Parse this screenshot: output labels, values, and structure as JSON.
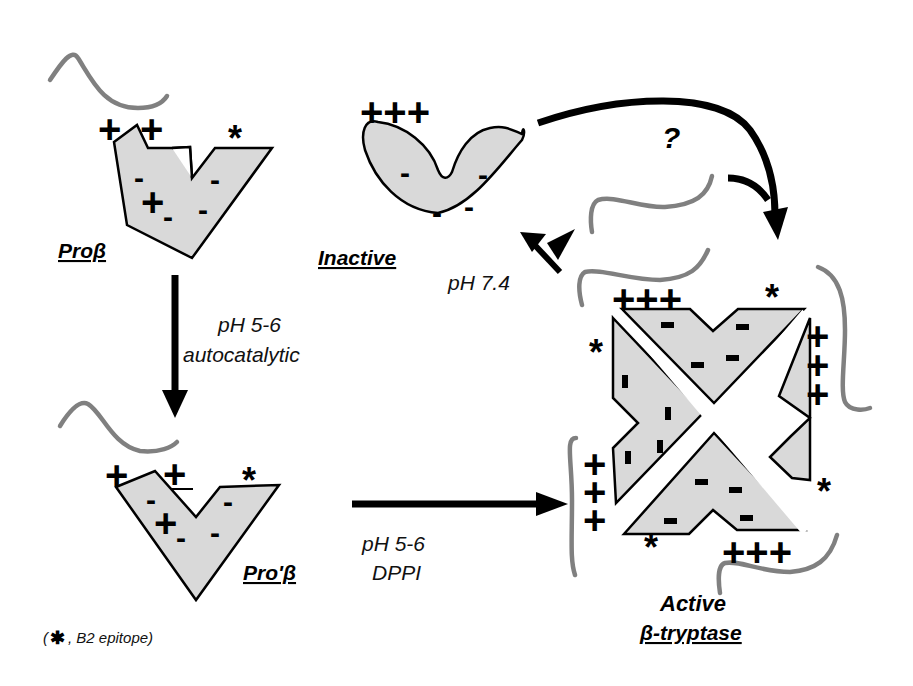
{
  "diagram": {
    "colors": {
      "protein_fill": "#d9d9d9",
      "outline": "#000000",
      "propeptide": "#808080",
      "arrow": "#000000"
    },
    "nodes": {
      "pro_beta": {
        "label": "Proβ",
        "charges_top": [
          "+",
          "+"
        ],
        "epitope": "*",
        "internal": [
          "-",
          "+",
          "-",
          "-",
          "-"
        ]
      },
      "inactive": {
        "label": "Inactive",
        "charges_top": "+++",
        "internal": [
          "-",
          "-",
          "-",
          "-"
        ]
      },
      "pro_prime_beta": {
        "label": "Pro'β",
        "charges_top": [
          "+",
          "+"
        ],
        "epitope": "*",
        "internal": [
          "-",
          "+",
          "-",
          "-",
          "-"
        ]
      },
      "active_tryptase": {
        "label_line1": "Active",
        "label_line2": "β-tryptase",
        "charges_top": "+++",
        "charges_bottom": "+++",
        "charges_right": [
          "+",
          "+",
          "+"
        ],
        "charges_left": [
          "+",
          "+",
          "+"
        ],
        "epitope": "*"
      }
    },
    "edges": {
      "pro_to_proprime": {
        "line1": "pH 5-6",
        "line2": "autocatalytic"
      },
      "proprime_to_active": {
        "line1": "pH 5-6",
        "line2": "DPPI"
      },
      "active_to_inactive": {
        "label": "pH 7.4"
      },
      "inactive_to_active": {
        "label": "?"
      }
    },
    "legend": {
      "open": "(",
      "symbol": "✱",
      "text": ", B2 epitope)"
    }
  }
}
